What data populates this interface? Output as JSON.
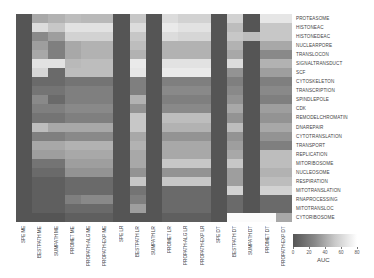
{
  "chart_data": {
    "type": "heatmap",
    "title": "",
    "colorbar": {
      "label": "AUC",
      "ticks": [
        0,
        20,
        40,
        60,
        80
      ],
      "range": [
        0,
        80
      ],
      "colormap": "gray (dark=low, white=high)"
    },
    "columns": [
      "SPE ME",
      "BESTPATH ME",
      "SUMPATH ME",
      "PROMET ME",
      "PROPATH-ALG ME",
      "PROPATH-EXP ME",
      "SPE LR",
      "BESTPATH LR",
      "SUMPATH LR",
      "PROMET LR",
      "PROPATH-ALG LR",
      "PROPATH-EXP LR",
      "SPE DT",
      "BESTPATH DT",
      "SUMPATH DT",
      "PROMET DT",
      "PROPATH-EXP DT"
    ],
    "rows": [
      "PROTEASOME",
      "HISTONEAC",
      "HISTONEDEAC",
      "NUCLEARPORE",
      "TRANSLOCON",
      "SIGNALTRANSDUCT",
      "SCF",
      "CYTOSKELETON",
      "TRANSCRIPTION",
      "SPINDLEPOLE",
      "CDK",
      "REMODELCHROMATIN",
      "DNAREPAIR",
      "CYTOTRANSLATION",
      "TRANSPORT",
      "REPLICATION",
      "MITORIBOSOME",
      "NUCLEOSOME",
      "RESPIRATION",
      "MITOTRANSLATION",
      "RNAPROCESSING",
      "MITOTRANSLOC",
      "CYTORIBOSOME"
    ],
    "values": [
      [
        0,
        40,
        45,
        50,
        48,
        48,
        0,
        55,
        0,
        65,
        60,
        60,
        0,
        60,
        0,
        70,
        70
      ],
      [
        0,
        65,
        55,
        68,
        68,
        68,
        0,
        65,
        0,
        72,
        68,
        68,
        0,
        50,
        0,
        55,
        55
      ],
      [
        0,
        25,
        35,
        60,
        60,
        60,
        0,
        55,
        0,
        65,
        62,
        62,
        0,
        55,
        50,
        55,
        55
      ],
      [
        0,
        35,
        20,
        40,
        45,
        45,
        0,
        50,
        0,
        45,
        45,
        45,
        0,
        45,
        0,
        40,
        40
      ],
      [
        0,
        40,
        20,
        40,
        45,
        45,
        0,
        45,
        0,
        45,
        45,
        45,
        0,
        40,
        0,
        25,
        25
      ],
      [
        0,
        68,
        68,
        48,
        50,
        50,
        0,
        72,
        0,
        68,
        68,
        68,
        0,
        65,
        0,
        45,
        45
      ],
      [
        0,
        62,
        10,
        50,
        50,
        50,
        0,
        70,
        0,
        72,
        72,
        72,
        0,
        30,
        0,
        35,
        35
      ],
      [
        0,
        10,
        10,
        15,
        15,
        15,
        0,
        20,
        0,
        20,
        20,
        20,
        0,
        20,
        0,
        20,
        20
      ],
      [
        0,
        15,
        15,
        20,
        20,
        20,
        0,
        20,
        0,
        25,
        25,
        25,
        0,
        25,
        0,
        25,
        25
      ],
      [
        0,
        25,
        10,
        20,
        20,
        20,
        0,
        45,
        0,
        20,
        20,
        20,
        0,
        30,
        0,
        20,
        20
      ],
      [
        0,
        20,
        20,
        25,
        25,
        25,
        0,
        30,
        0,
        25,
        25,
        25,
        0,
        40,
        0,
        35,
        35
      ],
      [
        0,
        15,
        15,
        20,
        20,
        20,
        0,
        55,
        0,
        50,
        50,
        50,
        0,
        30,
        0,
        30,
        30
      ],
      [
        0,
        50,
        40,
        40,
        40,
        40,
        0,
        55,
        0,
        45,
        45,
        45,
        0,
        50,
        0,
        40,
        40
      ],
      [
        0,
        20,
        20,
        25,
        25,
        25,
        0,
        40,
        0,
        30,
        30,
        30,
        0,
        30,
        0,
        30,
        30
      ],
      [
        0,
        40,
        40,
        45,
        45,
        45,
        0,
        45,
        0,
        40,
        40,
        40,
        0,
        35,
        0,
        20,
        20
      ],
      [
        0,
        35,
        35,
        40,
        40,
        40,
        0,
        40,
        0,
        40,
        40,
        40,
        0,
        40,
        0,
        50,
        50
      ],
      [
        0,
        15,
        15,
        35,
        35,
        35,
        0,
        40,
        0,
        55,
        55,
        55,
        0,
        55,
        0,
        50,
        50
      ],
      [
        0,
        10,
        10,
        30,
        30,
        30,
        0,
        30,
        0,
        30,
        30,
        30,
        0,
        35,
        0,
        45,
        45
      ],
      [
        0,
        5,
        5,
        10,
        10,
        10,
        0,
        55,
        0,
        55,
        55,
        55,
        0,
        35,
        0,
        50,
        50
      ],
      [
        0,
        5,
        5,
        10,
        10,
        10,
        0,
        15,
        0,
        10,
        10,
        10,
        0,
        60,
        0,
        60,
        60
      ],
      [
        0,
        5,
        5,
        20,
        25,
        25,
        0,
        20,
        0,
        10,
        10,
        10,
        0,
        10,
        0,
        10,
        10
      ],
      [
        0,
        5,
        5,
        10,
        10,
        10,
        0,
        35,
        0,
        10,
        10,
        10,
        0,
        10,
        0,
        10,
        10
      ],
      [
        0,
        0,
        0,
        5,
        5,
        5,
        0,
        0,
        0,
        5,
        5,
        5,
        0,
        80,
        80,
        80,
        40
      ]
    ]
  }
}
